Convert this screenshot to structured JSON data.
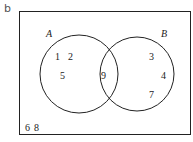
{
  "panel_label": "b",
  "diagram": {
    "type": "venn",
    "universe_only": [
      "6",
      "8"
    ],
    "sets": [
      {
        "name": "A",
        "only": [
          "1",
          "2",
          "5"
        ]
      },
      {
        "name": "B",
        "only": [
          "3",
          "4",
          "7"
        ]
      }
    ],
    "intersection": [
      "9"
    ]
  },
  "labels": {
    "A": "A",
    "B": "B",
    "a1": "1",
    "a2": "2",
    "a5": "5",
    "ab9": "9",
    "b3": "3",
    "b4": "4",
    "b7": "7",
    "u6": "6",
    "u8": "8"
  }
}
